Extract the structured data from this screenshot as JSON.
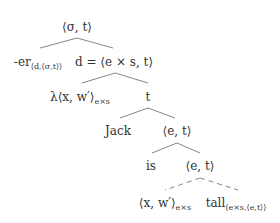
{
  "tree": {
    "root": {
      "label": "⟨σ, t⟩"
    },
    "er": {
      "main": "-er",
      "sub": "⟨d,⟨σ,t⟩⟩"
    },
    "d_node": {
      "label": "d = ⟨e × s, t⟩"
    },
    "lambda": {
      "main": "λ⟨x, w′⟩",
      "sub": "e×s"
    },
    "t_node": {
      "label": "t"
    },
    "jack": {
      "label": "Jack"
    },
    "et1": {
      "label": "⟨e, t⟩"
    },
    "is": {
      "label": "is"
    },
    "et2": {
      "label": "⟨e, t⟩"
    },
    "xw": {
      "main": "⟨x, w′⟩",
      "sub": "e×s"
    },
    "tall": {
      "main": "tall",
      "sub": "⟨e×s,⟨e,t⟩⟩"
    }
  },
  "edges": [
    {
      "from": "root",
      "to": "er",
      "style": "solid"
    },
    {
      "from": "root",
      "to": "d_node",
      "style": "solid"
    },
    {
      "from": "d_node",
      "to": "lambda",
      "style": "solid"
    },
    {
      "from": "d_node",
      "to": "t_node",
      "style": "solid"
    },
    {
      "from": "t_node",
      "to": "jack",
      "style": "solid"
    },
    {
      "from": "t_node",
      "to": "et1",
      "style": "solid"
    },
    {
      "from": "et1",
      "to": "is",
      "style": "solid"
    },
    {
      "from": "et1",
      "to": "et2",
      "style": "solid"
    },
    {
      "from": "et2",
      "to": "xw",
      "style": "dashed"
    },
    {
      "from": "et2",
      "to": "tall",
      "style": "dashed"
    }
  ]
}
